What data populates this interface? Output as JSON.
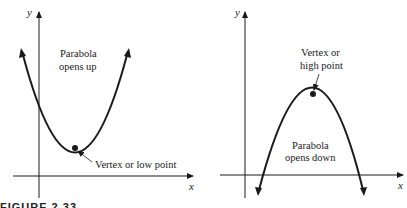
{
  "figure": {
    "caption": "FIGURE 2.33",
    "left_panel": {
      "x_axis_label": "x",
      "y_axis_label": "y",
      "title_line1": "Parabola",
      "title_line2": "opens up",
      "vertex_annotation": "Vertex or low point"
    },
    "right_panel": {
      "x_axis_label": "x",
      "y_axis_label": "y",
      "title_line1": "Parabola",
      "title_line2": "opens down",
      "vertex_annotation_line1": "Vertex or",
      "vertex_annotation_line2": "high point"
    },
    "colors": {
      "ink": "#1a1a1a",
      "background": "#ffffff"
    }
  }
}
